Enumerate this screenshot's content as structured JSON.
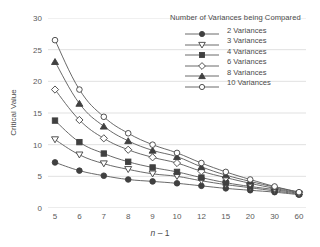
{
  "chart_data": {
    "type": "line",
    "title": "",
    "xlabel": "n - 1",
    "ylabel": "Critical Value",
    "x": [
      "5",
      "6",
      "7",
      "8",
      "9",
      "10",
      "12",
      "15",
      "20",
      "30",
      "60"
    ],
    "categories": [
      "5",
      "6",
      "7",
      "8",
      "9",
      "10",
      "12",
      "15",
      "20",
      "30",
      "60"
    ],
    "xtick_labels": [
      "5",
      "6",
      "7",
      "8",
      "9",
      "10",
      "12",
      "15",
      "20",
      "30",
      "60"
    ],
    "ylim": [
      0,
      30
    ],
    "ytick_labels": [
      "0",
      "5",
      "10",
      "15",
      "20",
      "25",
      "30"
    ],
    "ytick_values": [
      0,
      5,
      10,
      15,
      20,
      25,
      30
    ],
    "grid": "horizontal",
    "legend_position": "top-right",
    "legend_title": "Number of Variances being Compared",
    "series": [
      {
        "name": "2 Variances",
        "marker": "filled-circle",
        "values": [
          7.2,
          5.9,
          5.1,
          4.5,
          4.2,
          3.9,
          3.5,
          3.1,
          2.8,
          2.5,
          2.1
        ]
      },
      {
        "name": "3 Variances",
        "marker": "open-triangle-down",
        "values": [
          10.8,
          8.4,
          7.0,
          6.1,
          5.4,
          5.0,
          4.3,
          3.7,
          3.2,
          2.7,
          2.2
        ]
      },
      {
        "name": "4 Variances",
        "marker": "filled-square",
        "values": [
          13.8,
          10.4,
          8.6,
          7.3,
          6.4,
          5.7,
          4.8,
          4.0,
          3.4,
          2.9,
          2.3
        ]
      },
      {
        "name": "6 Variances",
        "marker": "open-diamond",
        "values": [
          18.7,
          13.9,
          11.0,
          9.2,
          8.0,
          7.1,
          5.8,
          4.8,
          3.9,
          3.1,
          2.4
        ]
      },
      {
        "name": "8 Variances",
        "marker": "filled-triangle-up",
        "values": [
          23.1,
          16.5,
          12.9,
          10.6,
          9.1,
          8.1,
          6.5,
          5.2,
          4.2,
          3.3,
          2.5
        ]
      },
      {
        "name": "10 Variances",
        "marker": "open-circle",
        "values": [
          26.5,
          18.7,
          14.4,
          11.8,
          10.0,
          8.7,
          7.1,
          5.7,
          4.5,
          3.4,
          2.5
        ]
      }
    ]
  },
  "axes": {
    "y_title": "Critical Value",
    "x_title_prefix": "n",
    "x_title_suffix": " – 1"
  },
  "legend": {
    "title": "Number of Variances being Compared",
    "items": [
      {
        "label": "2 Variances"
      },
      {
        "label": "3 Variances"
      },
      {
        "label": "4 Variances"
      },
      {
        "label": "6 Variances"
      },
      {
        "label": "8 Variances"
      },
      {
        "label": "10 Variances"
      }
    ]
  },
  "colors": {
    "line": "#595959",
    "marker_fill": "#404040",
    "marker_open": "#ffffff",
    "grid": "#d9d9d9",
    "text": "#4a4a4a",
    "background": "#ffffff"
  }
}
